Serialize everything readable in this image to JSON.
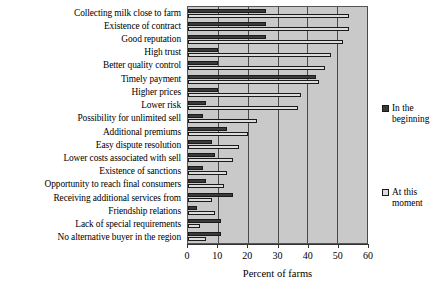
{
  "chart_data": {
    "type": "bar",
    "orientation": "horizontal",
    "title": "",
    "xlabel": "Percent of farms",
    "ylabel": "",
    "xlim": [
      0,
      60
    ],
    "xticks": [
      0,
      10,
      20,
      30,
      40,
      50,
      60
    ],
    "grid": true,
    "legend_position": "right",
    "categories": [
      "Collecting milk close to farm",
      "Existence of contract",
      "Good reputation",
      "High trust",
      "Better quality control",
      "Timely payment",
      "Higher prices",
      "Lower risk",
      "Possibility for unlimited sell",
      "Additional premiums",
      "Easy dispute resolution",
      "Lower costs associated with sell",
      "Existence of sanctions",
      "Opportunity to reach final consumers",
      "Receiving additional services from",
      "Friendship relations",
      "Lack of special requirements",
      "No alternative buyer in the region"
    ],
    "series": [
      {
        "name": "In the beginning",
        "color": "#3a3a3a",
        "values": [
          26,
          26,
          26,
          10,
          10,
          43,
          10,
          6,
          5,
          13,
          8,
          9,
          5,
          6,
          15,
          3,
          11,
          11
        ]
      },
      {
        "name": "At this moment",
        "color": "#dcdcdc",
        "values": [
          54,
          54,
          52,
          48,
          46,
          44,
          38,
          37,
          23,
          20,
          17,
          15,
          13,
          12,
          8,
          9,
          4,
          6
        ]
      }
    ]
  },
  "legend": {
    "entries": [
      {
        "label": "In the beginning",
        "color": "#3a3a3a"
      },
      {
        "label": "At this moment",
        "color": "#dcdcdc"
      }
    ]
  },
  "axis": {
    "x_title": "Percent of farms",
    "tick_labels": [
      "0",
      "10",
      "20",
      "30",
      "40",
      "50",
      "60"
    ]
  },
  "colors": {
    "plot_background": "#c9c9c9",
    "gridline": "#4a4a4a",
    "bar_outline": "#1a1a1a",
    "axis": "#333333"
  }
}
